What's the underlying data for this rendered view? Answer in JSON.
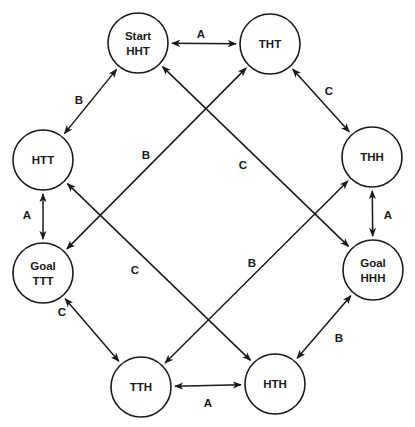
{
  "diagram": {
    "type": "state-transition-graph",
    "node_radius": 30,
    "colors": {
      "stroke": "#1a1a1a",
      "background": "#ffffff"
    },
    "nodes": [
      {
        "id": "HHT",
        "lines": [
          "Start",
          "HHT"
        ],
        "x": 138,
        "y": 43
      },
      {
        "id": "THT",
        "lines": [
          "THT"
        ],
        "x": 270,
        "y": 44
      },
      {
        "id": "HTT",
        "lines": [
          "HTT"
        ],
        "x": 43,
        "y": 160
      },
      {
        "id": "THH",
        "lines": [
          "THH"
        ],
        "x": 372,
        "y": 157
      },
      {
        "id": "TTT",
        "lines": [
          "Goal",
          "TTT"
        ],
        "x": 43,
        "y": 273
      },
      {
        "id": "HHH",
        "lines": [
          "Goal",
          "HHH"
        ],
        "x": 373,
        "y": 270
      },
      {
        "id": "TTH",
        "lines": [
          "TTH"
        ],
        "x": 141,
        "y": 387
      },
      {
        "id": "HTH",
        "lines": [
          "HTH"
        ],
        "x": 275,
        "y": 384
      }
    ],
    "edges": [
      {
        "from": "HHT",
        "to": "THT",
        "label": "A",
        "lx": 201,
        "ly": 38
      },
      {
        "from": "HHT",
        "to": "HTT",
        "label": "B",
        "lx": 79,
        "ly": 104
      },
      {
        "from": "THT",
        "to": "THH",
        "label": "C",
        "lx": 329,
        "ly": 95
      },
      {
        "from": "HTT",
        "to": "TTT",
        "label": "A",
        "lx": 27,
        "ly": 219
      },
      {
        "from": "THH",
        "to": "HHH",
        "label": "A",
        "lx": 388,
        "ly": 219
      },
      {
        "from": "TTT",
        "to": "TTH",
        "label": "C",
        "lx": 62,
        "ly": 316
      },
      {
        "from": "HHH",
        "to": "HTH",
        "label": "B",
        "lx": 339,
        "ly": 342
      },
      {
        "from": "TTH",
        "to": "HTH",
        "label": "A",
        "lx": 208,
        "ly": 407
      },
      {
        "from": "THT",
        "to": "TTT",
        "label": "B",
        "lx": 146,
        "ly": 159
      },
      {
        "from": "HHT",
        "to": "HHH",
        "label": "C",
        "lx": 243,
        "ly": 169
      },
      {
        "from": "HTT",
        "to": "HTH",
        "label": "C",
        "lx": 135,
        "ly": 274
      },
      {
        "from": "THH",
        "to": "TTH",
        "label": "B",
        "lx": 252,
        "ly": 267
      }
    ]
  }
}
